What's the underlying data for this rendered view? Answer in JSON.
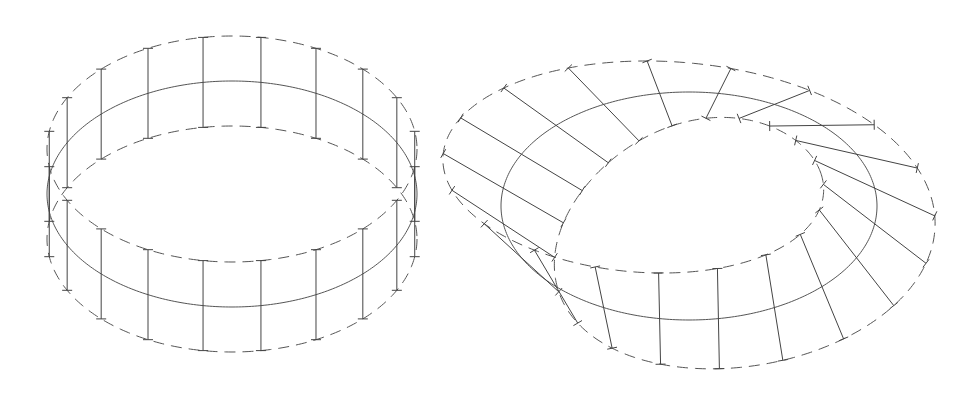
{
  "diagram": {
    "background": "#ffffff",
    "line_color": "#555555",
    "figures": [
      {
        "id": "cylinder-band",
        "label": "",
        "center": [
          232,
          194
        ],
        "rx": 185,
        "ry": 113,
        "half_height": 45,
        "band_type": "cylinder",
        "rulings": 20,
        "ruling_phase_deg": 9
      },
      {
        "id": "mobius-band",
        "label": "",
        "center": [
          689,
          206
        ],
        "rx": 188,
        "ry": 114,
        "half_height": 80,
        "band_type": "mobius",
        "rulings": 20,
        "ruling_phase_deg": 9
      }
    ]
  }
}
